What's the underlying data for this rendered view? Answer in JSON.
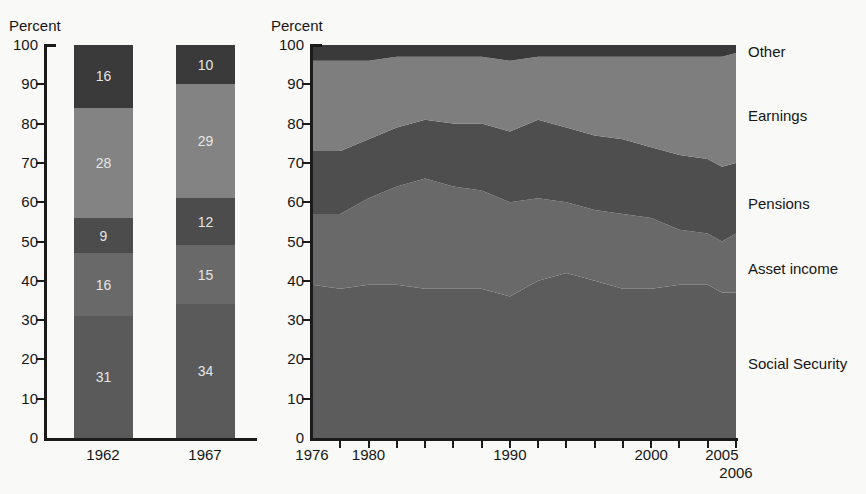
{
  "chart_data": [
    {
      "type": "bar",
      "stacked": true,
      "ylabel": "Percent",
      "ylim": [
        0,
        100
      ],
      "y_ticks": [
        0,
        10,
        20,
        30,
        40,
        50,
        60,
        70,
        80,
        90,
        100
      ],
      "categories": [
        "1962",
        "1967"
      ],
      "series": [
        {
          "name": "Social Security",
          "color": "#5a5a5a",
          "values": [
            31,
            34
          ]
        },
        {
          "name": "Asset income",
          "color": "#696969",
          "values": [
            16,
            15
          ]
        },
        {
          "name": "Pensions",
          "color": "#4c4c4c",
          "values": [
            9,
            12
          ]
        },
        {
          "name": "Earnings",
          "color": "#838383",
          "values": [
            28,
            29
          ]
        },
        {
          "name": "Other",
          "color": "#3a3a3a",
          "values": [
            16,
            10
          ]
        }
      ],
      "value_label_color": "#e5e5e5",
      "grid": false,
      "legend_position": "none"
    },
    {
      "type": "area",
      "stacked": true,
      "ylabel": "Percent",
      "ylim": [
        0,
        100
      ],
      "y_ticks": [
        0,
        10,
        20,
        30,
        40,
        50,
        60,
        70,
        80,
        90,
        100
      ],
      "xlim": [
        1976,
        2006
      ],
      "x": [
        1976,
        1978,
        1980,
        1982,
        1984,
        1986,
        1988,
        1990,
        1992,
        1994,
        1996,
        1998,
        2000,
        2002,
        2004,
        2005,
        2006
      ],
      "x_axis_labels": [
        "1976",
        "1980",
        "1990",
        "2000",
        "2005"
      ],
      "x_axis_label_years": [
        1976,
        1980,
        1990,
        2000,
        2005
      ],
      "x_axis_extra_label": "2006",
      "x_axis_extra_label_year": 2006,
      "series": [
        {
          "name": "Social Security",
          "color": "#5c5c5c",
          "values": [
            39,
            38,
            39,
            39,
            38,
            38,
            38,
            36,
            40,
            42,
            40,
            38,
            38,
            39,
            39,
            37,
            37
          ]
        },
        {
          "name": "Asset income",
          "color": "#696969",
          "values": [
            18,
            19,
            22,
            25,
            28,
            26,
            25,
            24,
            21,
            18,
            18,
            19,
            18,
            14,
            13,
            13,
            15
          ]
        },
        {
          "name": "Pensions",
          "color": "#4e4e4e",
          "values": [
            16,
            16,
            15,
            15,
            15,
            16,
            17,
            18,
            20,
            19,
            19,
            19,
            18,
            19,
            19,
            19,
            18
          ]
        },
        {
          "name": "Earnings",
          "color": "#7e7e7e",
          "values": [
            23,
            23,
            20,
            18,
            16,
            17,
            17,
            18,
            16,
            18,
            20,
            21,
            23,
            25,
            26,
            28,
            28
          ]
        },
        {
          "name": "Other",
          "color": "#3a3a3a",
          "values": [
            4,
            4,
            4,
            3,
            3,
            3,
            3,
            4,
            3,
            3,
            3,
            3,
            3,
            3,
            3,
            3,
            2
          ]
        }
      ],
      "right_labels": [
        "Other",
        "Earnings",
        "Pensions",
        "Asset income",
        "Social Security"
      ],
      "grid": false,
      "legend_position": "right"
    }
  ]
}
